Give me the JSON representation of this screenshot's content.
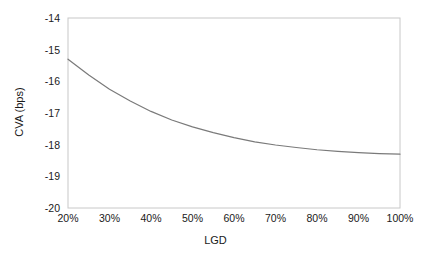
{
  "chart_data": {
    "type": "line",
    "title": "",
    "xlabel": "LGD",
    "ylabel": "CVA (bps)",
    "xlim": [
      20,
      100
    ],
    "ylim": [
      -20,
      -14
    ],
    "xticks": [
      "20%",
      "30%",
      "40%",
      "50%",
      "60%",
      "70%",
      "80%",
      "90%",
      "100%"
    ],
    "yticks": [
      "-14",
      "-15",
      "-16",
      "-17",
      "-18",
      "-19",
      "-20"
    ],
    "grid": false,
    "legend": null,
    "line_color": "#7a7a7a",
    "x": [
      20,
      25,
      30,
      35,
      40,
      45,
      50,
      55,
      60,
      65,
      70,
      75,
      80,
      85,
      90,
      95,
      100
    ],
    "values": [
      -15.3,
      -15.8,
      -16.25,
      -16.62,
      -16.95,
      -17.22,
      -17.44,
      -17.62,
      -17.78,
      -17.91,
      -18.01,
      -18.09,
      -18.16,
      -18.21,
      -18.25,
      -18.28,
      -18.3
    ],
    "series": [
      {
        "name": "CVA",
        "values": [
          -15.3,
          -15.8,
          -16.25,
          -16.62,
          -16.95,
          -17.22,
          -17.44,
          -17.62,
          -17.78,
          -17.91,
          -18.01,
          -18.09,
          -18.16,
          -18.21,
          -18.25,
          -18.28,
          -18.3
        ]
      }
    ]
  },
  "axis": {
    "y_label": "CVA (bps)",
    "x_label": "LGD",
    "y_tick_labels": [
      "-14",
      "-15",
      "-16",
      "-17",
      "-18",
      "-19",
      "-20"
    ],
    "x_tick_labels": [
      "20%",
      "30%",
      "40%",
      "50%",
      "60%",
      "70%",
      "80%",
      "90%",
      "100%"
    ]
  }
}
